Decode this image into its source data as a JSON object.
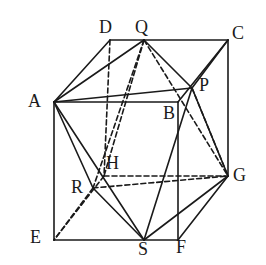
{
  "figure": {
    "kind": "geometry-diagram",
    "stroke_color": "#1a1a1a",
    "background_color": "#ffffff",
    "solid_stroke_width": 1.6,
    "dashed_stroke_width": 1.6,
    "dash_pattern": "5,3"
  },
  "points": {
    "A": {
      "label": "A",
      "x": 54,
      "y": 102,
      "label_x": 28,
      "label_y": 92
    },
    "B": {
      "label": "B",
      "x": 178,
      "y": 102,
      "label_x": 163,
      "label_y": 104
    },
    "C": {
      "label": "C",
      "x": 228,
      "y": 40,
      "label_x": 232,
      "label_y": 24
    },
    "D": {
      "label": "D",
      "x": 110,
      "y": 40,
      "label_x": 99,
      "label_y": 18
    },
    "E": {
      "label": "E",
      "x": 54,
      "y": 240,
      "label_x": 30,
      "label_y": 228
    },
    "F": {
      "label": "F",
      "x": 178,
      "y": 240,
      "label_x": 176,
      "label_y": 238
    },
    "G": {
      "label": "G",
      "x": 228,
      "y": 176,
      "label_x": 233,
      "label_y": 166
    },
    "H": {
      "label": "H",
      "x": 104,
      "y": 176,
      "label_x": 106,
      "label_y": 154
    },
    "P": {
      "label": "P",
      "x": 192,
      "y": 88,
      "label_x": 199,
      "label_y": 76
    },
    "Q": {
      "label": "Q",
      "x": 144,
      "y": 40,
      "label_x": 135,
      "label_y": 18
    },
    "R": {
      "label": "R",
      "x": 93,
      "y": 188,
      "label_x": 71,
      "label_y": 178
    },
    "S": {
      "label": "S",
      "x": 144,
      "y": 240,
      "label_x": 138,
      "label_y": 240
    }
  },
  "edges": {
    "solid": [
      {
        "name": "edge-A-D",
        "from": "A",
        "to": "D"
      },
      {
        "name": "edge-D-C",
        "from": "D",
        "to": "C"
      },
      {
        "name": "edge-C-G",
        "from": "C",
        "to": "G"
      },
      {
        "name": "edge-A-B",
        "from": "A",
        "to": "B"
      },
      {
        "name": "edge-B-F",
        "from": "B",
        "to": "F"
      },
      {
        "name": "edge-A-E",
        "from": "A",
        "to": "E"
      },
      {
        "name": "edge-E-F",
        "from": "E",
        "to": "F"
      },
      {
        "name": "edge-F-G",
        "from": "F",
        "to": "G"
      },
      {
        "name": "edge-B-C",
        "from": "B",
        "to": "C"
      },
      {
        "name": "edge-A-Q",
        "from": "A",
        "to": "Q"
      },
      {
        "name": "edge-Q-P",
        "from": "Q",
        "to": "P"
      },
      {
        "name": "edge-A-P",
        "from": "A",
        "to": "P"
      },
      {
        "name": "edge-P-G",
        "from": "P",
        "to": "G"
      },
      {
        "name": "edge-P-S",
        "from": "P",
        "to": "S"
      },
      {
        "name": "edge-S-G",
        "from": "S",
        "to": "G"
      },
      {
        "name": "edge-A-S",
        "from": "A",
        "to": "S"
      },
      {
        "name": "edge-A-R",
        "from": "A",
        "to": "R"
      },
      {
        "name": "edge-R-S",
        "from": "R",
        "to": "S"
      },
      {
        "name": "edge-C-P",
        "from": "C",
        "to": "P"
      }
    ],
    "dashed": [
      {
        "name": "edge-D-H",
        "from": "D",
        "to": "H"
      },
      {
        "name": "edge-H-G",
        "from": "H",
        "to": "G"
      },
      {
        "name": "edge-H-E",
        "from": "H",
        "to": "E"
      },
      {
        "name": "edge-Q-H",
        "from": "Q",
        "to": "H"
      },
      {
        "name": "edge-Q-R",
        "from": "Q",
        "to": "R"
      },
      {
        "name": "edge-Q-G",
        "from": "Q",
        "to": "G"
      },
      {
        "name": "edge-R-G",
        "from": "R",
        "to": "G"
      },
      {
        "name": "edge-R-E",
        "from": "R",
        "to": "E"
      },
      {
        "name": "edge-P-G-back",
        "from": "P",
        "to": "G"
      }
    ]
  },
  "label_order": [
    "D",
    "Q",
    "C",
    "A",
    "P",
    "B",
    "H",
    "R",
    "G",
    "E",
    "S",
    "F"
  ]
}
